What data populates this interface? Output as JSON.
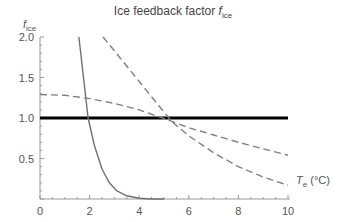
{
  "chart_data": {
    "type": "line",
    "title_main": "Ice feedback factor ",
    "title_symbol": "f",
    "title_sub": "ice",
    "xlabel": "T_e (°C)",
    "ylabel": "f_ice",
    "xlim": [
      0,
      10
    ],
    "ylim": [
      0,
      2.0
    ],
    "xticks": [
      "0",
      "2",
      "4",
      "6",
      "8",
      "10"
    ],
    "yticks": [
      "0.5",
      "1.0",
      "1.5",
      "2.0"
    ],
    "grid": false,
    "legend": null,
    "series": [
      {
        "name": "reference f=1",
        "style": "solid-thick",
        "color": "#000000",
        "x": [
          0,
          10
        ],
        "y": [
          1.0,
          1.0
        ]
      },
      {
        "name": "steep solid decay",
        "style": "solid",
        "color": "#707070",
        "x": [
          1.57,
          1.94,
          2.2,
          2.5,
          2.8,
          3.1,
          3.5,
          4.0,
          4.5,
          5.0
        ],
        "y": [
          2.0,
          1.0,
          0.65,
          0.37,
          0.2,
          0.1,
          0.04,
          0.01,
          0.0,
          0.0
        ]
      },
      {
        "name": "shallow dashed",
        "style": "dashed",
        "color": "#808080",
        "x": [
          0,
          1,
          2,
          3,
          4,
          5.3,
          6,
          7,
          8,
          9,
          10
        ],
        "y": [
          1.29,
          1.28,
          1.24,
          1.18,
          1.1,
          0.96,
          0.88,
          0.79,
          0.7,
          0.62,
          0.54
        ]
      },
      {
        "name": "steep dashed",
        "style": "dashed",
        "color": "#808080",
        "x": [
          2.54,
          3,
          4,
          5.3,
          6,
          7,
          8,
          9,
          10
        ],
        "y": [
          2.0,
          1.83,
          1.45,
          0.96,
          0.78,
          0.57,
          0.4,
          0.27,
          0.17
        ]
      }
    ]
  }
}
